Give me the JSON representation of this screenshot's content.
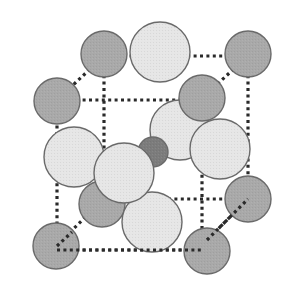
{
  "diagram": {
    "colors": {
      "background": "#ffffff",
      "dark_sphere_fill": "#a9a9a9",
      "light_sphere_fill": "#e6e6e6",
      "center_sphere_fill": "#7c7c7c",
      "sphere_stroke": "#6a6a6a",
      "cell_edge": "#2a2a2a"
    },
    "cell_edges": [
      {
        "x1": 104,
        "y1": 56,
        "x2": 248,
        "y2": 56
      },
      {
        "x1": 104,
        "y1": 56,
        "x2": 104,
        "y2": 202
      },
      {
        "x1": 248,
        "y1": 56,
        "x2": 248,
        "y2": 199
      },
      {
        "x1": 104,
        "y1": 56,
        "x2": 57,
        "y2": 100
      },
      {
        "x1": 248,
        "y1": 56,
        "x2": 202,
        "y2": 98
      },
      {
        "x1": 57,
        "y1": 100,
        "x2": 202,
        "y2": 100
      },
      {
        "x1": 57,
        "y1": 100,
        "x2": 57,
        "y2": 246
      },
      {
        "x1": 202,
        "y1": 98,
        "x2": 202,
        "y2": 250
      },
      {
        "x1": 104,
        "y1": 199,
        "x2": 248,
        "y2": 199
      },
      {
        "x1": 248,
        "y1": 199,
        "x2": 207,
        "y2": 240
      },
      {
        "x1": 104,
        "y1": 199,
        "x2": 62,
        "y2": 240
      },
      {
        "x1": 57,
        "y1": 250,
        "x2": 202,
        "y2": 250
      }
    ],
    "spheres": [
      {
        "id": "dark-back-bottom-mid",
        "cx": 102,
        "cy": 204,
        "r": 23,
        "kind": "dark"
      },
      {
        "id": "light-bottom-back",
        "cx": 152,
        "cy": 222,
        "r": 30,
        "kind": "light"
      },
      {
        "id": "dark-corner-top-back-left",
        "cx": 104,
        "cy": 54,
        "r": 23,
        "kind": "dark"
      },
      {
        "id": "dark-corner-top-back-right",
        "cx": 248,
        "cy": 54,
        "r": 23,
        "kind": "dark"
      },
      {
        "id": "light-face-top",
        "cx": 160,
        "cy": 52,
        "r": 30,
        "kind": "light"
      },
      {
        "id": "light-face-back",
        "cx": 180,
        "cy": 130,
        "r": 30,
        "kind": "light"
      },
      {
        "id": "dark-corner-top-front-right",
        "cx": 202,
        "cy": 98,
        "r": 23,
        "kind": "dark"
      },
      {
        "id": "dark-corner-top-front-left",
        "cx": 57,
        "cy": 101,
        "r": 23,
        "kind": "dark"
      },
      {
        "id": "light-face-left",
        "cx": 74,
        "cy": 157,
        "r": 30,
        "kind": "light"
      },
      {
        "id": "light-face-right",
        "cx": 220,
        "cy": 149,
        "r": 30,
        "kind": "light"
      },
      {
        "id": "center-atom",
        "cx": 153,
        "cy": 152,
        "r": 15,
        "kind": "center"
      },
      {
        "id": "dark-corner-bottom-back-right",
        "cx": 248,
        "cy": 199,
        "r": 23,
        "kind": "dark"
      },
      {
        "id": "light-face-front",
        "cx": 124,
        "cy": 173,
        "r": 30,
        "kind": "light"
      },
      {
        "id": "dark-corner-bottom-front-left",
        "cx": 56,
        "cy": 246,
        "r": 23,
        "kind": "dark"
      },
      {
        "id": "dark-corner-bottom-front-right",
        "cx": 207,
        "cy": 251,
        "r": 23,
        "kind": "dark"
      }
    ],
    "front_edges": [
      {
        "x1": 57,
        "y1": 250,
        "x2": 202,
        "y2": 250
      },
      {
        "x1": 207,
        "y1": 240,
        "x2": 248,
        "y2": 199
      },
      {
        "x1": 57,
        "y1": 246,
        "x2": 72,
        "y2": 232
      }
    ]
  }
}
